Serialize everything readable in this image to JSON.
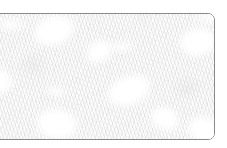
{
  "page": {
    "background_color": "#ffffff",
    "width": 227,
    "height": 148
  },
  "card": {
    "name": "texture-panel",
    "border_color": "#8a8a8a",
    "border_radius_px": 7,
    "fill_color": "#fafafa",
    "description": "Rounded-corner bordered panel filled with a very light gray mottled fibrous texture",
    "bleeds_off_left_edge": true
  },
  "texture": {
    "base_color": "#fafafa",
    "grain_color": "#969696",
    "highlight_color": "#ffffff",
    "pattern": "fibrous-mottled",
    "blobs": [
      {
        "name": "highlight-top-left",
        "left_pct": 29,
        "top_pct": 13,
        "w": 30,
        "h": 19,
        "rotate": -18
      },
      {
        "name": "highlight-left-edge",
        "left_pct": 2,
        "top_pct": 53,
        "w": 26,
        "h": 17,
        "rotate": 12
      },
      {
        "name": "highlight-center-right",
        "left_pct": 62,
        "top_pct": 61,
        "w": 34,
        "h": 19,
        "rotate": -22
      },
      {
        "name": "highlight-bottom-left",
        "left_pct": 30,
        "top_pct": 88,
        "w": 30,
        "h": 20,
        "rotate": 8
      },
      {
        "name": "highlight-top-right",
        "left_pct": 93,
        "top_pct": 22,
        "w": 26,
        "h": 18,
        "rotate": -10
      },
      {
        "name": "highlight-bottom-right",
        "left_pct": 96,
        "top_pct": 93,
        "w": 24,
        "h": 16,
        "rotate": 15
      },
      {
        "name": "highlight-upper-mid",
        "left_pct": 49,
        "top_pct": 30,
        "w": 16,
        "h": 11,
        "rotate": -30
      },
      {
        "name": "highlight-lower-mid",
        "left_pct": 78,
        "top_pct": 84,
        "w": 18,
        "h": 12,
        "rotate": 20
      }
    ]
  }
}
